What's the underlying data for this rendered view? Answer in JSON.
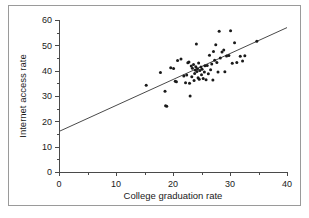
{
  "figure": {
    "border_color": "#9a9a9a",
    "background": "#ffffff",
    "point_color": "#1a1a1a",
    "line_color": "#4a4a4a"
  },
  "chart_data": {
    "type": "scatter",
    "title": "",
    "xlabel": "College graduation rate",
    "ylabel": "Internet access rate",
    "xlim": [
      0,
      40
    ],
    "ylim": [
      0,
      60
    ],
    "xticks": [
      0,
      10,
      20,
      30,
      40
    ],
    "yticks": [
      0,
      10,
      20,
      30,
      40,
      50,
      60
    ],
    "xticklabels": [
      "0",
      "10",
      "20",
      "30",
      "40"
    ],
    "yticklabels": [
      "0",
      "10",
      "20",
      "30",
      "40",
      "50",
      "60"
    ],
    "x_minor_ticks": [
      5,
      15,
      25,
      35
    ],
    "y_minor_ticks": [
      5,
      15,
      25,
      35,
      45,
      55
    ],
    "grid": false,
    "legend": null,
    "trendline": {
      "type": "linear",
      "x": [
        0,
        40
      ],
      "y": [
        16.0,
        57.0
      ],
      "intercept": 16.0,
      "slope": 1.025
    },
    "points": [
      {
        "x": 15.3,
        "y": 34.2
      },
      {
        "x": 17.8,
        "y": 39.3
      },
      {
        "x": 18.6,
        "y": 31.9
      },
      {
        "x": 18.7,
        "y": 26.2
      },
      {
        "x": 18.9,
        "y": 26.0
      },
      {
        "x": 19.6,
        "y": 41.2
      },
      {
        "x": 20.1,
        "y": 40.9
      },
      {
        "x": 20.4,
        "y": 35.8
      },
      {
        "x": 20.6,
        "y": 35.6
      },
      {
        "x": 20.8,
        "y": 44.0
      },
      {
        "x": 21.4,
        "y": 44.6
      },
      {
        "x": 21.9,
        "y": 37.9
      },
      {
        "x": 22.2,
        "y": 35.2
      },
      {
        "x": 22.4,
        "y": 38.3
      },
      {
        "x": 22.6,
        "y": 43.1
      },
      {
        "x": 22.8,
        "y": 43.4
      },
      {
        "x": 22.9,
        "y": 35.0
      },
      {
        "x": 23.0,
        "y": 30.0
      },
      {
        "x": 23.2,
        "y": 41.8
      },
      {
        "x": 23.3,
        "y": 37.6
      },
      {
        "x": 23.4,
        "y": 41.0
      },
      {
        "x": 23.6,
        "y": 42.4
      },
      {
        "x": 23.7,
        "y": 36.1
      },
      {
        "x": 23.8,
        "y": 38.9
      },
      {
        "x": 23.9,
        "y": 40.3
      },
      {
        "x": 24.0,
        "y": 41.5
      },
      {
        "x": 24.1,
        "y": 50.5
      },
      {
        "x": 24.2,
        "y": 39.7
      },
      {
        "x": 24.3,
        "y": 40.8
      },
      {
        "x": 24.4,
        "y": 37.2
      },
      {
        "x": 24.5,
        "y": 43.0
      },
      {
        "x": 24.6,
        "y": 36.6
      },
      {
        "x": 24.7,
        "y": 40.1
      },
      {
        "x": 24.9,
        "y": 41.4
      },
      {
        "x": 25.0,
        "y": 38.4
      },
      {
        "x": 25.1,
        "y": 40.6
      },
      {
        "x": 25.3,
        "y": 36.9
      },
      {
        "x": 25.5,
        "y": 39.5
      },
      {
        "x": 25.6,
        "y": 41.9
      },
      {
        "x": 25.8,
        "y": 36.4
      },
      {
        "x": 26.0,
        "y": 42.0
      },
      {
        "x": 26.2,
        "y": 38.8
      },
      {
        "x": 26.4,
        "y": 46.1
      },
      {
        "x": 26.6,
        "y": 40.4
      },
      {
        "x": 26.8,
        "y": 42.6
      },
      {
        "x": 27.0,
        "y": 36.3
      },
      {
        "x": 27.1,
        "y": 47.6
      },
      {
        "x": 27.3,
        "y": 44.1
      },
      {
        "x": 27.5,
        "y": 50.2
      },
      {
        "x": 27.7,
        "y": 43.2
      },
      {
        "x": 27.9,
        "y": 39.5
      },
      {
        "x": 28.1,
        "y": 55.6
      },
      {
        "x": 28.3,
        "y": 45.0
      },
      {
        "x": 28.6,
        "y": 47.4
      },
      {
        "x": 28.9,
        "y": 48.2
      },
      {
        "x": 29.1,
        "y": 39.6
      },
      {
        "x": 29.4,
        "y": 45.8
      },
      {
        "x": 29.8,
        "y": 46.0
      },
      {
        "x": 30.1,
        "y": 55.8
      },
      {
        "x": 30.4,
        "y": 42.9
      },
      {
        "x": 30.8,
        "y": 51.0
      },
      {
        "x": 31.2,
        "y": 43.2
      },
      {
        "x": 31.8,
        "y": 45.7
      },
      {
        "x": 32.2,
        "y": 43.8
      },
      {
        "x": 32.6,
        "y": 45.9
      },
      {
        "x": 34.7,
        "y": 51.6
      }
    ]
  }
}
